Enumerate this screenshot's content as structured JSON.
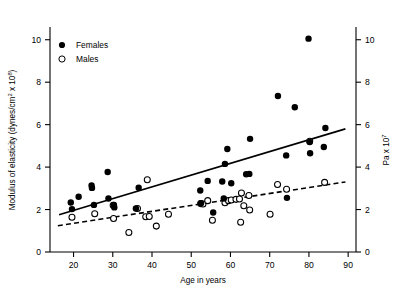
{
  "chart_data": {
    "type": "scatter",
    "title": "",
    "xlabel": "Age in years",
    "ylabel": "Modulus of elasticity (dynes/cm2 x 108)",
    "ylabel_parts": {
      "main": "Modulus of elasticity (dynes/cm",
      "sup1": "2",
      "mid": " x 10",
      "sup2": "8",
      "tail": ")"
    },
    "y2label": "Pa x 107",
    "y2label_parts": {
      "main": "Pa x 10",
      "sup": "7"
    },
    "xlim": [
      14,
      92
    ],
    "ylim": [
      0,
      10.6
    ],
    "y2lim": [
      0,
      10.6
    ],
    "grid": false,
    "xticks": [
      20,
      30,
      40,
      50,
      60,
      70,
      80,
      90
    ],
    "yticks": [
      0,
      2,
      4,
      6,
      8,
      10
    ],
    "y2ticks": [
      0,
      2,
      4,
      6,
      8,
      10
    ],
    "legend_position": "top-left",
    "legend": [
      {
        "name": "Females",
        "marker": "filled-circle",
        "color": "#000000"
      },
      {
        "name": "Males",
        "marker": "open-circle",
        "color": "#000000"
      }
    ],
    "series": [
      {
        "name": "Females",
        "marker": "filled-circle",
        "points": [
          [
            19.3,
            2.33
          ],
          [
            19.6,
            2.02
          ],
          [
            21.3,
            2.6
          ],
          [
            24.6,
            3.13
          ],
          [
            24.7,
            3.02
          ],
          [
            25.2,
            2.22
          ],
          [
            28.7,
            3.77
          ],
          [
            28.9,
            2.52
          ],
          [
            30.3,
            2.22
          ],
          [
            30.4,
            2.1
          ],
          [
            35.9,
            2.05
          ],
          [
            36.6,
            3.03
          ],
          [
            52.3,
            2.9
          ],
          [
            52.5,
            2.3
          ],
          [
            54.2,
            3.35
          ],
          [
            55.6,
            1.86
          ],
          [
            57.9,
            3.32
          ],
          [
            58.3,
            2.52
          ],
          [
            58.6,
            4.15
          ],
          [
            59.2,
            4.85
          ],
          [
            60.2,
            3.24
          ],
          [
            64.0,
            3.66
          ],
          [
            64.8,
            3.68
          ],
          [
            65.0,
            5.33
          ],
          [
            72.1,
            7.35
          ],
          [
            74.2,
            4.55
          ],
          [
            74.4,
            2.55
          ],
          [
            76.4,
            6.82
          ],
          [
            79.9,
            10.05
          ],
          [
            80.2,
            5.18
          ],
          [
            80.3,
            4.65
          ],
          [
            83.8,
            4.95
          ],
          [
            84.2,
            5.84
          ]
        ]
      },
      {
        "name": "Males",
        "marker": "open-circle",
        "points": [
          [
            19.6,
            1.64
          ],
          [
            25.4,
            1.8
          ],
          [
            30.1,
            2.2
          ],
          [
            30.2,
            1.58
          ],
          [
            34.1,
            0.92
          ],
          [
            36.3,
            2.05
          ],
          [
            38.4,
            1.66
          ],
          [
            38.8,
            3.4
          ],
          [
            39.3,
            1.67
          ],
          [
            41.1,
            1.22
          ],
          [
            44.2,
            1.78
          ],
          [
            52.4,
            2.28
          ],
          [
            53.0,
            2.26
          ],
          [
            54.2,
            2.42
          ],
          [
            55.4,
            1.5
          ],
          [
            58.6,
            2.32
          ],
          [
            59.5,
            2.42
          ],
          [
            60.2,
            2.45
          ],
          [
            61.4,
            2.48
          ],
          [
            62.3,
            2.5
          ],
          [
            62.6,
            1.4
          ],
          [
            62.8,
            2.78
          ],
          [
            63.4,
            2.18
          ],
          [
            64.7,
            2.66
          ],
          [
            64.9,
            1.98
          ],
          [
            70.1,
            1.78
          ],
          [
            72.0,
            3.18
          ],
          [
            74.3,
            2.96
          ],
          [
            80.2,
            5.22
          ],
          [
            84.0,
            3.28
          ]
        ]
      }
    ],
    "trend_lines": [
      {
        "name": "Females trend",
        "style": "solid",
        "x": [
          16.3,
          89.3
        ],
        "y": [
          1.76,
          5.8
        ]
      },
      {
        "name": "Males trend",
        "style": "dashed",
        "x": [
          16.0,
          89.3
        ],
        "y": [
          1.24,
          3.3
        ]
      }
    ]
  }
}
